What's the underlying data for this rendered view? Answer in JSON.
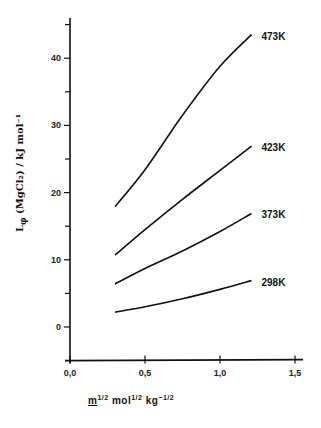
{
  "chart_data": {
    "type": "line",
    "title": "",
    "xlabel": "m^1/2 mol^1/2 kg^-1/2",
    "ylabel": "L_φ(MgCl2) / kJ mol^-1",
    "xlim": [
      0.0,
      1.5
    ],
    "ylim": [
      -5,
      46
    ],
    "x_ticks": [
      "0,0",
      "0,5",
      "1,0",
      "1,5"
    ],
    "y_ticks": [
      "0",
      "10",
      "20",
      "30",
      "40"
    ],
    "grid": false,
    "legend": "inline labels at curve ends",
    "series": [
      {
        "name": "473K",
        "x": [
          0.3,
          0.5,
          0.75,
          1.0,
          1.21
        ],
        "values": [
          17.9,
          23.4,
          31.5,
          38.8,
          43.5
        ]
      },
      {
        "name": "423K",
        "x": [
          0.3,
          0.5,
          0.75,
          1.0,
          1.21
        ],
        "values": [
          10.7,
          14.5,
          19.0,
          23.3,
          26.9
        ]
      },
      {
        "name": "373K",
        "x": [
          0.3,
          0.5,
          0.75,
          1.0,
          1.21
        ],
        "values": [
          6.4,
          8.7,
          11.3,
          14.2,
          16.9
        ]
      },
      {
        "name": "298K",
        "x": [
          0.3,
          0.5,
          0.75,
          1.0,
          1.21
        ],
        "values": [
          2.2,
          3.0,
          4.2,
          5.6,
          6.9
        ]
      }
    ]
  },
  "labels": {
    "ylabel_main": "L",
    "ylabel_sub": "φ",
    "ylabel_rest": " (MgCl₂) / kJ mol⁻¹",
    "xlabel_m": "m",
    "xlabel_rest": " mol",
    "xlabel_kg": " kg",
    "half": "1/2",
    "neg_half": "−1/2"
  }
}
